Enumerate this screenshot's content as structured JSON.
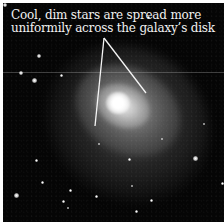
{
  "figure": {
    "caption_lines": [
      "Cool, dim stars are spread more",
      "uniformily across the galaxy’s disk"
    ],
    "colors": {
      "background": "#050505",
      "border": "#ffffff",
      "caption_text": "#f2f2f2",
      "pointer_lines": "#f5f5f5"
    },
    "pointer_lines": [
      {
        "x1": 104,
        "y1": 38,
        "x2": 95,
        "y2": 126
      },
      {
        "x1": 104,
        "y1": 38,
        "x2": 146,
        "y2": 93
      }
    ]
  }
}
